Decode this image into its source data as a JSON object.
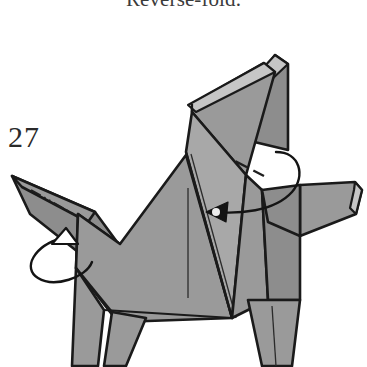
{
  "page": {
    "background_color": "#ffffff",
    "width": 367,
    "height": 367
  },
  "caption": {
    "text": "Reverse-fold.",
    "color": "#3b3b3b",
    "clipped_at_top": true
  },
  "step": {
    "number": "27",
    "color": "#2a2a2a"
  },
  "diagram": {
    "kind": "origami-instruction-diagram",
    "colors": {
      "paper_front": "#9a9a9a",
      "paper_front_light": "#adadad",
      "paper_edge": "#c3c3c3",
      "paper_shadow": "#8a8a8a",
      "outline": "#1a1a1a",
      "crease_line": "#2b2b2b",
      "arrow": "#141414",
      "highlight_dot": "#ededed"
    },
    "parts": [
      {
        "name": "upright-ear-flap-back",
        "description": "tall rear layer of raised flap at top center-right"
      },
      {
        "name": "upright-ear-flap-front",
        "description": "front layer of raised flap, slightly offset left"
      },
      {
        "name": "head",
        "description": "sharp pointed snout projecting up-left"
      },
      {
        "name": "foreleg-front",
        "description": "front-most leg below body"
      },
      {
        "name": "foreleg-back",
        "description": "second leg separated by narrow notch"
      },
      {
        "name": "body",
        "description": "large central quadrilateral panel"
      },
      {
        "name": "hindquarter",
        "description": "rear panel at right of body"
      },
      {
        "name": "tail-flap",
        "description": "horizontal flap extending to the right edge"
      },
      {
        "name": "hindleg",
        "description": "tapering rear leg"
      }
    ],
    "fold_marks": [
      {
        "name": "mountain-fold-head",
        "style": "dash-dot-dot",
        "location": "along the snout"
      },
      {
        "name": "valley-fold-ear",
        "style": "dashed",
        "location": "across the raised flap, slanting down-right"
      },
      {
        "name": "crease-body-vertical",
        "style": "solid-thin",
        "location": "center of body panel"
      }
    ],
    "arrows": [
      {
        "name": "rotate-arrow-head",
        "style": "hollow-head-looping",
        "direction": "up-left",
        "location": "beneath the snout"
      },
      {
        "name": "reverse-fold-arrow-tail",
        "style": "solid-head-curved",
        "direction": "leftward into the body",
        "location": "from the right flap toward the body center"
      }
    ]
  }
}
